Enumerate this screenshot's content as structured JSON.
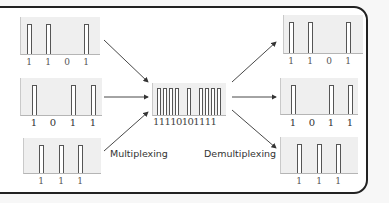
{
  "diagram": {
    "labels": {
      "multiplexing": "Multiplexing",
      "demultiplexing": "Demultiplexing"
    },
    "inputs": [
      {
        "id": "in1",
        "bits": [
          "1",
          "1",
          "0",
          "1"
        ]
      },
      {
        "id": "in2",
        "bits": [
          "1",
          "0",
          "1",
          "1"
        ]
      },
      {
        "id": "in3",
        "bits": [
          "1",
          "1",
          "1"
        ]
      }
    ],
    "multiplexed": {
      "bits_text": "11110101111"
    },
    "outputs": [
      {
        "id": "out1",
        "bits": [
          "1",
          "1",
          "0",
          "1"
        ]
      },
      {
        "id": "out2",
        "bits": [
          "1",
          "0",
          "1",
          "1"
        ]
      },
      {
        "id": "out3",
        "bits": [
          "1",
          "1",
          "1"
        ]
      }
    ],
    "colors": {
      "frame": "#222222",
      "panel": "#efefef",
      "pulse": "#555555",
      "arrow": "#333333"
    }
  }
}
